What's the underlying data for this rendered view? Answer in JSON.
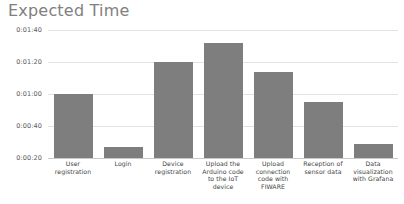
{
  "chart": {
    "title": "Expected Time"
  },
  "chart_data": {
    "type": "bar",
    "title": "Expected Time",
    "xlabel": "",
    "ylabel": "",
    "grid": true,
    "legend": null,
    "categories": [
      "User registration",
      "Login",
      "Device registration",
      "Upload the Arduino code to the IoT device",
      "Upload connection code with FIWARE",
      "Reception of sensor data",
      "Data visualization with Grafana"
    ],
    "category_lines": [
      [
        "User",
        "registration"
      ],
      [
        "Login"
      ],
      [
        "Device",
        "registration"
      ],
      [
        "Upload the",
        "Arduino code",
        "to the IoT",
        "device"
      ],
      [
        "Upload",
        "connection",
        "code with",
        "FIWARE"
      ],
      [
        "Reception of",
        "sensor data"
      ],
      [
        "Data",
        "visualization",
        "with Grafana"
      ]
    ],
    "values": [
      60,
      27,
      80,
      92,
      74,
      55,
      29
    ],
    "value_labels": [
      "0:01:00",
      "0:00:27",
      "0:01:20",
      "0:01:32",
      "0:01:14",
      "0:00:55",
      "0:00:29"
    ],
    "ylim": [
      20,
      100
    ],
    "ytick_values": [
      100,
      80,
      60,
      40,
      20
    ],
    "ytick_labels": [
      "0:01:40",
      "0:01:20",
      "0:01:00",
      "0:00:40",
      "0:00:20"
    ],
    "bar_color": "#7e7e7e",
    "gridline_color": "#e2e2e2",
    "title_color": "#808080"
  }
}
